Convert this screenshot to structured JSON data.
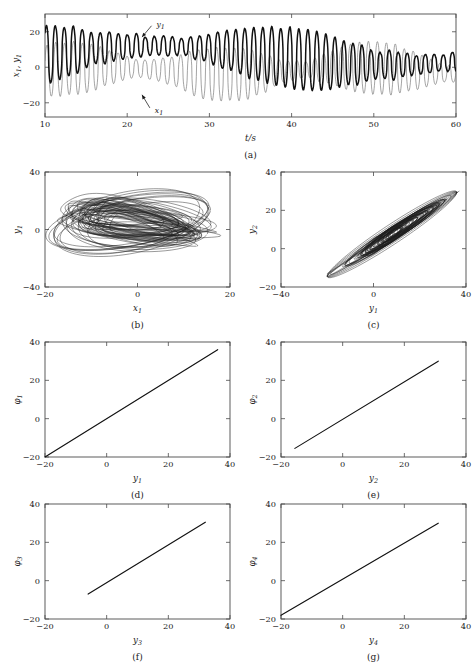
{
  "figure": {
    "background": "#ffffff",
    "foreground": "#1a1a1a"
  },
  "chart_data": [
    {
      "id": "a",
      "type": "line",
      "caption": "(a)",
      "title": "",
      "xlabel": "t/s",
      "ylabel": "x₁, y₁",
      "xlim": [
        10,
        60
      ],
      "ylim": [
        -28,
        30
      ],
      "xticks": [
        10,
        20,
        30,
        40,
        50,
        60
      ],
      "xticklabels": [
        "10",
        "20",
        "30",
        "40",
        "50",
        "60"
      ],
      "yticks": [
        -20,
        0,
        20
      ],
      "yticklabels": [
        "-20",
        "0",
        "20"
      ],
      "grid": false,
      "legend": "none",
      "annotations": [
        {
          "text": "y₁",
          "x": 23.2,
          "y": 24.5,
          "target_x": 21.8,
          "target_y": 17.0
        },
        {
          "text": "x₁",
          "x": 23.0,
          "y": -24.0,
          "target_x": 21.8,
          "target_y": -15.5
        }
      ],
      "series": [
        {
          "name": "y₁",
          "style": "thick",
          "color": "#111111",
          "description": "driver response signal, spiky quasi-periodic oscillation, range about -22 to 28"
        },
        {
          "name": "x₁",
          "style": "thin",
          "color": "#6b6b6b",
          "description": "chaotic drive signal, range about -20 to 20"
        }
      ]
    },
    {
      "id": "b",
      "type": "line",
      "caption": "(b)",
      "title": "",
      "xlabel": "x₁",
      "ylabel": "y₁",
      "xlim": [
        -20,
        20
      ],
      "ylim": [
        -40,
        40
      ],
      "xticks": [
        -20,
        0,
        20
      ],
      "xticklabels": [
        "-20",
        "0",
        "20"
      ],
      "yticks": [
        -40,
        0,
        40
      ],
      "yticklabels": [
        "-40",
        "0",
        "40"
      ],
      "grid": false,
      "legend": "none",
      "series": [
        {
          "name": "phase portrait x₁ vs y₁",
          "style": "attractor",
          "color": "#1d1d1d",
          "description": "dense banded chaotic attractor loops spanning x -18..19, y -22..32"
        }
      ]
    },
    {
      "id": "c",
      "type": "line",
      "caption": "(c)",
      "title": "",
      "xlabel": "y₁",
      "ylabel": "y₂",
      "xlim": [
        -40,
        40
      ],
      "ylim": [
        -20,
        40
      ],
      "xticks": [
        -40,
        0,
        40
      ],
      "xticklabels": [
        "-40",
        "0",
        "40"
      ],
      "yticks": [
        -20,
        0,
        20,
        40
      ],
      "yticklabels": [
        "-20",
        "0",
        "20",
        "40"
      ],
      "grid": false,
      "legend": "none",
      "series": [
        {
          "name": "synchronisation manifold y₁ vs y₂",
          "style": "attractor",
          "color": "#1d1d1d",
          "description": "elongated diagonal cloud along the identity line from (-20,-13) to (37,30)"
        }
      ]
    },
    {
      "id": "d",
      "type": "line",
      "caption": "(d)",
      "title": "",
      "xlabel": "y₁",
      "ylabel": "φ₁",
      "xlim": [
        -20,
        40
      ],
      "ylim": [
        -20,
        40
      ],
      "xticks": [
        -20,
        0,
        20,
        40
      ],
      "xticklabels": [
        "-20",
        "0",
        "20",
        "40"
      ],
      "yticks": [
        -20,
        0,
        20,
        40
      ],
      "yticklabels": [
        "-20",
        "0",
        "20",
        "40"
      ],
      "grid": false,
      "legend": "none",
      "series": [
        {
          "name": "φ₁ vs y₁",
          "style": "line",
          "color": "#111111",
          "x": [
            -20.0,
            36.0
          ],
          "values": [
            -20.0,
            36.0
          ]
        }
      ]
    },
    {
      "id": "e",
      "type": "line",
      "caption": "(e)",
      "title": "",
      "xlabel": "y₂",
      "ylabel": "φ₂",
      "xlim": [
        -20,
        40
      ],
      "ylim": [
        -20,
        40
      ],
      "xticks": [
        -20,
        0,
        20,
        40
      ],
      "xticklabels": [
        "-20",
        "0",
        "20",
        "40"
      ],
      "yticks": [
        -20,
        0,
        20,
        40
      ],
      "yticklabels": [
        "-20",
        "0",
        "20",
        "40"
      ],
      "grid": false,
      "legend": "none",
      "series": [
        {
          "name": "φ₂ vs y₂",
          "style": "line",
          "color": "#111111",
          "x": [
            -15.5,
            31.0
          ],
          "values": [
            -15.5,
            30.0
          ]
        }
      ]
    },
    {
      "id": "f",
      "type": "line",
      "caption": "(f)",
      "title": "",
      "xlabel": "y₃",
      "ylabel": "φ₃",
      "xlim": [
        -20,
        40
      ],
      "ylim": [
        -20,
        40
      ],
      "xticks": [
        -20,
        0,
        20,
        40
      ],
      "xticklabels": [
        "-20",
        "0",
        "20",
        "40"
      ],
      "yticks": [
        -20,
        0,
        20,
        40
      ],
      "yticklabels": [
        "-20",
        "0",
        "20",
        "40"
      ],
      "grid": false,
      "legend": "none",
      "series": [
        {
          "name": "φ₃ vs y₃",
          "style": "line",
          "color": "#111111",
          "x": [
            -6.0,
            32.0
          ],
          "values": [
            -7.0,
            30.5
          ]
        }
      ]
    },
    {
      "id": "g",
      "type": "line",
      "caption": "(g)",
      "title": "",
      "xlabel": "y₄",
      "ylabel": "φ₄",
      "xlim": [
        -20,
        40
      ],
      "ylim": [
        -20,
        40
      ],
      "xticks": [
        -20,
        0,
        20,
        40
      ],
      "xticklabels": [
        "-20",
        "0",
        "20",
        "40"
      ],
      "yticks": [
        -20,
        0,
        20,
        40
      ],
      "yticklabels": [
        "-20",
        "0",
        "20",
        "40"
      ],
      "grid": false,
      "legend": "none",
      "series": [
        {
          "name": "φ₄ vs y₄",
          "style": "line",
          "color": "#111111",
          "x": [
            -20.0,
            31.0
          ],
          "values": [
            -18.0,
            30.0
          ]
        }
      ]
    }
  ]
}
